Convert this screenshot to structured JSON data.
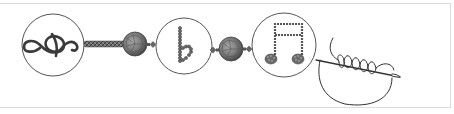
{
  "illustration": {
    "caption": "Beaded music-symbol bracelet with needle and thread",
    "colors": {
      "background": "#ffffff",
      "frame": "#dcdcdc",
      "outline": "#555555",
      "bead_dark": "#555555",
      "bead_mid": "#7a7a7a",
      "bead_light": "#9a9a9a",
      "thread": "#333333"
    },
    "elements": [
      {
        "id": "circle-1",
        "symbol": "treble-clef",
        "label": "Treble clef"
      },
      {
        "id": "rope-1",
        "symbol": "beaded-rope",
        "label": "Beaded rope"
      },
      {
        "id": "bead-1",
        "symbol": "faceted-bead",
        "label": "Faceted bead"
      },
      {
        "id": "circle-2",
        "symbol": "flat-sign",
        "label": "Flat sign"
      },
      {
        "id": "bead-2",
        "symbol": "faceted-bead",
        "label": "Faceted bead"
      },
      {
        "id": "circle-3",
        "symbol": "beamed-eighth-notes",
        "label": "Beamed eighth notes"
      },
      {
        "id": "needle",
        "symbol": "needle-with-thread",
        "label": "Needle with coiled thread"
      }
    ]
  }
}
